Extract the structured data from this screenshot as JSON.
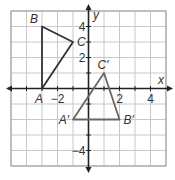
{
  "figure": {
    "type": "coordinate-plane",
    "x_range": [
      -5,
      5
    ],
    "y_range": [
      -5,
      5
    ],
    "axis_labels": {
      "x": "x",
      "y": "y"
    },
    "tick_labels": {
      "x": [
        {
          "value": -2,
          "label": "−2"
        },
        {
          "value": 2,
          "label": "2"
        },
        {
          "value": 4,
          "label": "4"
        }
      ],
      "y": [
        {
          "value": 4,
          "label": "4"
        },
        {
          "value": 2,
          "label": "2"
        },
        {
          "value": -4,
          "label": "−4"
        }
      ]
    },
    "colors": {
      "grid": "#c8c8c8",
      "axis": "#222222",
      "preimage": "#333333",
      "image": "#666666",
      "border": "#999999"
    },
    "triangles": [
      {
        "name": "ABC",
        "vertices": [
          {
            "label": "A",
            "x": -3,
            "y": 0
          },
          {
            "label": "B",
            "x": -3,
            "y": 4
          },
          {
            "label": "C",
            "x": -1,
            "y": 3
          }
        ]
      },
      {
        "name": "A'B'C'",
        "vertices": [
          {
            "label": "A′",
            "x": -1,
            "y": -2
          },
          {
            "label": "B′",
            "x": 2,
            "y": -2
          },
          {
            "label": "C′",
            "x": 1,
            "y": 1
          }
        ]
      }
    ]
  }
}
